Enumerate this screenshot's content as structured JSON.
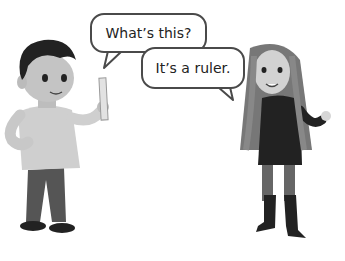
{
  "scene": {
    "description": "Two cartoon children talking; boy holds a ruler",
    "bubbles": [
      {
        "speaker": "boy",
        "text": "What’s this?"
      },
      {
        "speaker": "girl",
        "text": "It’s a ruler."
      }
    ],
    "colors": {
      "bubble_border": "#4a4a4a",
      "text": "#222222",
      "background": "#ffffff"
    }
  }
}
